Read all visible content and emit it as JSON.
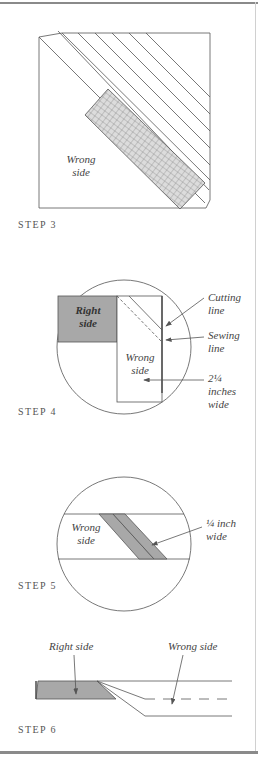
{
  "steps": [
    {
      "label": "STEP 3",
      "annotations": {
        "wrong_side": [
          "Wrong",
          "side"
        ]
      }
    },
    {
      "label": "STEP 4",
      "annotations": {
        "right_side": [
          "Right",
          "side"
        ],
        "wrong_side": [
          "Wrong",
          "side"
        ],
        "cutting_line": [
          "Cutting",
          "line"
        ],
        "sewing_line": [
          "Sewing",
          "line"
        ],
        "width": [
          "2¼",
          "inches",
          "wide"
        ]
      }
    },
    {
      "label": "STEP 5",
      "annotations": {
        "wrong_side": [
          "Wrong",
          "side"
        ],
        "seam": [
          "¼ inch",
          "wide"
        ]
      }
    },
    {
      "label": "STEP 6",
      "annotations": {
        "right_side": "Right side",
        "wrong_side": "Wrong side"
      }
    }
  ],
  "colors": {
    "line": "#555555",
    "fill_gray": "#a8a8a8",
    "ruler_fill": "#dcdcdc",
    "frame": "#8a8a8a"
  }
}
